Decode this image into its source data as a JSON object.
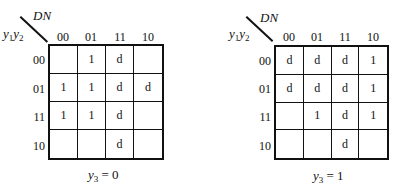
{
  "maps": [
    {
      "column_variable": "DN",
      "row_variable": {
        "base1": "y",
        "sub1": "1",
        "base2": "y",
        "sub2": "2"
      },
      "column_headers": [
        "00",
        "01",
        "11",
        "10"
      ],
      "row_headers": [
        "00",
        "01",
        "11",
        "10"
      ],
      "cells": [
        [
          "",
          "1",
          "d",
          ""
        ],
        [
          "1",
          "1",
          "d",
          "d"
        ],
        [
          "1",
          "1",
          "d",
          ""
        ],
        [
          "",
          "",
          "d",
          ""
        ]
      ],
      "caption": {
        "var": "y",
        "sub": "3",
        "eq": " = 0"
      }
    },
    {
      "column_variable": "DN",
      "row_variable": {
        "base1": "y",
        "sub1": "1",
        "base2": "y",
        "sub2": "2"
      },
      "column_headers": [
        "00",
        "01",
        "11",
        "10"
      ],
      "row_headers": [
        "00",
        "01",
        "11",
        "10"
      ],
      "cells": [
        [
          "d",
          "d",
          "d",
          "1"
        ],
        [
          "d",
          "d",
          "d",
          "1"
        ],
        [
          "",
          "1",
          "d",
          "1"
        ],
        [
          "",
          "",
          "d",
          ""
        ]
      ],
      "caption": {
        "var": "y",
        "sub": "3",
        "eq": " = 1"
      }
    }
  ]
}
